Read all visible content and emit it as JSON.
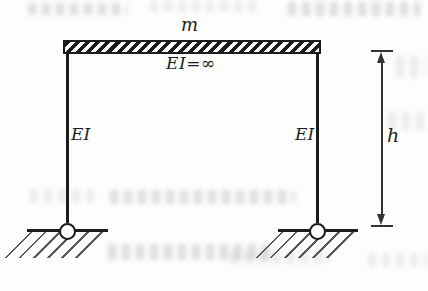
{
  "figure": {
    "type": "structural-diagram",
    "labels": {
      "mass": "m",
      "beam_stiffness": "EI=∞",
      "left_column_stiffness": "EI",
      "right_column_stiffness": "EI",
      "height_dimension": "h"
    },
    "colors": {
      "line": "#1c1c1c",
      "dimension": "#333333",
      "ground_hatch": "#565656",
      "background": "#fdfdfc",
      "bleedthrough": "#b0b0b0"
    }
  }
}
